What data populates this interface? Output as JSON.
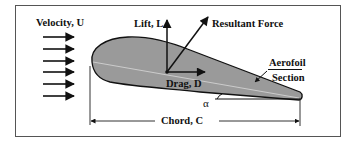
{
  "diagram": {
    "labels": {
      "velocity": "Velocity, U",
      "lift": "Lift, L",
      "resultant": "Resultant Force",
      "drag": "Drag, D",
      "aerofoil_line1": "Aerofoil",
      "aerofoil_line2": "Section",
      "alpha": "α",
      "chord": "Chord, C"
    },
    "flow_arrows": {
      "count": 6,
      "y_positions": [
        37,
        49,
        61,
        72,
        84,
        96
      ],
      "x_start": 43,
      "x_end": 74
    },
    "colors": {
      "aerofoil_fill": "#9a9a9a",
      "stroke": "#111111",
      "border": "#555555",
      "background": "#ffffff"
    }
  }
}
